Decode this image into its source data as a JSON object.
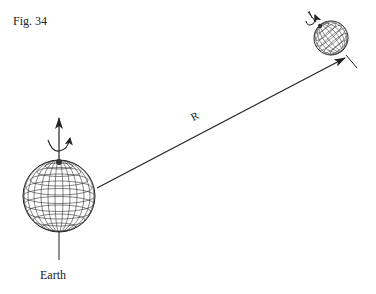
{
  "figure": {
    "label": "Fig. 34",
    "distance_label": "R",
    "bodies": [
      {
        "name": "Earth",
        "label": "Earth",
        "cx": 59,
        "cy": 196,
        "r": 36,
        "axis": "vertical",
        "has_label": true
      },
      {
        "name": "distant-body",
        "label": "",
        "cx": 331,
        "cy": 38,
        "r": 17,
        "axis": "tilted",
        "has_label": false
      }
    ],
    "vector": {
      "from": [
        97,
        188
      ],
      "to": [
        345,
        58
      ],
      "label": "R"
    }
  },
  "colors": {
    "ink": "#222222",
    "background": "#ffffff"
  }
}
